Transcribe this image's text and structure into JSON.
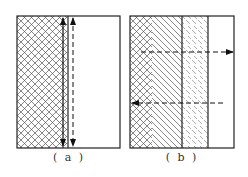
{
  "figure": {
    "panels": [
      {
        "id": "a",
        "caption": "( a )",
        "regions": [
          "crosshatched material",
          "clear region"
        ],
        "arrows": [
          {
            "style": "solid",
            "direction": "vertical-bidirectional"
          },
          {
            "style": "dashed",
            "direction": "vertical-bidirectional"
          }
        ]
      },
      {
        "id": "b",
        "caption": "( b )",
        "regions": [
          "crosshatched-to-diagonal hatched layer",
          "fine dashed-hatch layer",
          "clear region"
        ],
        "arrows": [
          {
            "style": "dashed",
            "direction": "right"
          },
          {
            "style": "dashed",
            "direction": "left"
          }
        ]
      }
    ],
    "colors": {
      "line": "#222222",
      "hatch": "#555555",
      "background": "#ffffff"
    }
  }
}
